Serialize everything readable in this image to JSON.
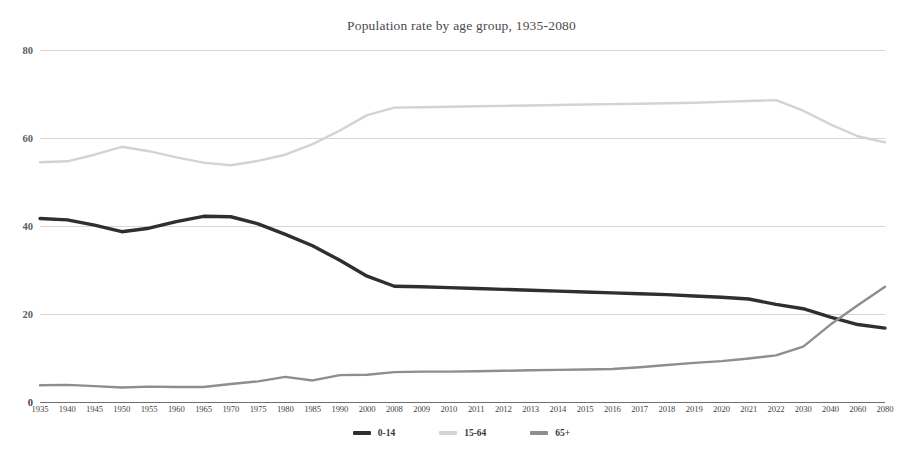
{
  "chart_data": {
    "type": "line",
    "title": "Population rate by age group, 1935-2080",
    "xlabel": "",
    "ylabel": "",
    "ylim": [
      0,
      80
    ],
    "yticks": [
      0,
      20,
      40,
      60,
      80
    ],
    "grid": true,
    "legend_position": "bottom",
    "categories": [
      "1935",
      "1940",
      "1945",
      "1950",
      "1955",
      "1960",
      "1965",
      "1970",
      "1975",
      "1980",
      "1985",
      "1990",
      "2000",
      "2008",
      "2009",
      "2010",
      "2011",
      "2012",
      "2013",
      "2014",
      "2015",
      "2016",
      "2017",
      "2018",
      "2019",
      "2020",
      "2021",
      "2022",
      "2030",
      "2040",
      "2060",
      "2080"
    ],
    "series": [
      {
        "name": "0-14",
        "color": "#2f2f33",
        "values": [
          41.7,
          41.4,
          40.2,
          38.7,
          39.5,
          41.0,
          42.2,
          42.1,
          40.5,
          38.1,
          35.5,
          32.2,
          28.6,
          26.3,
          26.2,
          26.0,
          25.8,
          25.6,
          25.4,
          25.2,
          25.0,
          24.8,
          24.6,
          24.4,
          24.1,
          23.8,
          23.4,
          22.2,
          21.2,
          19.3,
          17.6,
          16.8
        ]
      },
      {
        "name": "15-64",
        "color": "#d3d3d6",
        "values": [
          54.5,
          54.7,
          56.2,
          58.0,
          57.0,
          55.6,
          54.4,
          53.8,
          54.8,
          56.2,
          58.6,
          61.7,
          65.2,
          66.9,
          67.0,
          67.1,
          67.2,
          67.3,
          67.4,
          67.5,
          67.6,
          67.7,
          67.8,
          67.9,
          68.0,
          68.2,
          68.4,
          68.6,
          66.2,
          63.1,
          60.4,
          59.0
        ]
      },
      {
        "name": "65+",
        "color": "#8d8d92",
        "values": [
          3.8,
          3.9,
          3.6,
          3.3,
          3.5,
          3.4,
          3.4,
          4.1,
          4.7,
          5.7,
          4.9,
          6.1,
          6.2,
          6.8,
          6.9,
          6.9,
          7.0,
          7.1,
          7.2,
          7.3,
          7.4,
          7.5,
          7.9,
          8.4,
          8.9,
          9.3,
          9.9,
          10.6,
          12.6,
          17.6,
          22.0,
          26.2
        ]
      }
    ]
  },
  "legend": {
    "items": [
      {
        "label": "0-14"
      },
      {
        "label": "15-64"
      },
      {
        "label": "65+"
      }
    ]
  }
}
